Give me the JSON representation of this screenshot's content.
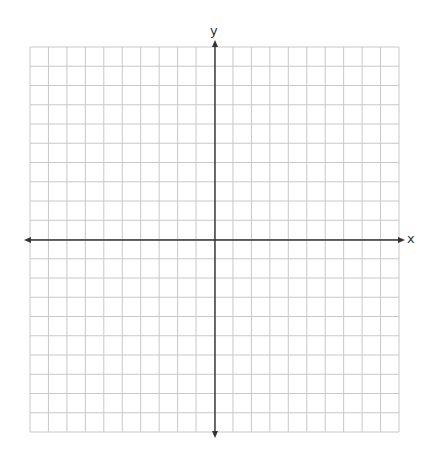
{
  "diagram": {
    "type": "coordinate-plane",
    "grid": {
      "columns": 20,
      "rows": 20,
      "left": 30,
      "top": 47,
      "right": 399,
      "bottom": 432,
      "line_color": "#c8c8c8"
    },
    "axes": {
      "color": "#333333",
      "x_axis": {
        "label": "x",
        "y": 240,
        "from": 24,
        "to": 405
      },
      "y_axis": {
        "label": "y",
        "x": 215,
        "from": 40,
        "to": 438
      }
    }
  }
}
